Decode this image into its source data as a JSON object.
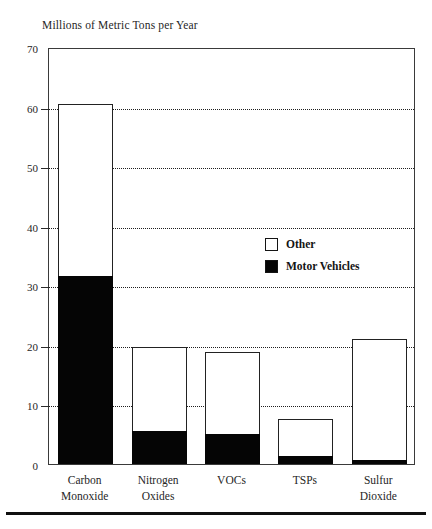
{
  "chart_data": {
    "type": "bar",
    "title": "Millions of Metric Tons per Year",
    "subtitle": "",
    "xlabel": "",
    "ylabel": "",
    "stacked": true,
    "grid": true,
    "legend_position": "inside-right",
    "ylim": [
      0,
      70
    ],
    "yticks": [
      0,
      10,
      20,
      30,
      40,
      50,
      60,
      70
    ],
    "ytick_labels": [
      "0",
      "10",
      "20",
      "30",
      "40",
      "50",
      "60",
      "70"
    ],
    "categories": [
      "Carbon Monoxide",
      "Nitrogen Oxides",
      "VOCs",
      "TSPs",
      "Sulfur Dioxide"
    ],
    "category_lines": [
      [
        "Carbon",
        "Monoxide"
      ],
      [
        "Nitrogen",
        "Oxides"
      ],
      [
        "VOCs",
        ""
      ],
      [
        "TSPs",
        ""
      ],
      [
        "Sulfur",
        "Dioxide"
      ]
    ],
    "series": [
      {
        "name": "Motor Vehicles",
        "color": "#050505",
        "values": [
          31.5,
          5.5,
          5.0,
          1.3,
          0.7
        ]
      },
      {
        "name": "Other",
        "color": "#ffffff",
        "values": [
          29.0,
          14.2,
          13.8,
          6.2,
          20.3
        ]
      }
    ],
    "totals": [
      60.5,
      19.7,
      18.8,
      7.5,
      21.0
    ]
  },
  "legend": {
    "items": [
      {
        "label": "Other",
        "style": "hollow"
      },
      {
        "label": "Motor Vehicles",
        "style": "filled"
      }
    ]
  },
  "colors": {
    "motor_vehicles": "#050505",
    "other": "#ffffff",
    "axis": "#2a2a2a",
    "grid": "#1f1f1f",
    "text": "#262626"
  }
}
